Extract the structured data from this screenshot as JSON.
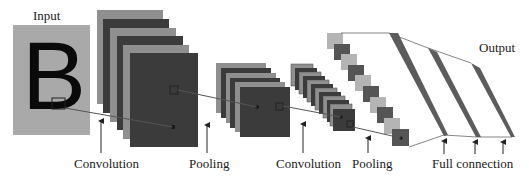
{
  "labels": {
    "input": "Input",
    "output": "Output",
    "conv1": "Convolution",
    "pool1": "Pooling",
    "conv2": "Convolution",
    "pool2": "Pooling",
    "fc": "Full connection"
  },
  "input_letter": "B",
  "colors": {
    "input_bg": "#a9a9a9",
    "layer_light": "#8f8f8f",
    "layer_dark": "#3b3b3b",
    "pool_light": "#b4b4b4",
    "pool_dark": "#555555",
    "stripe": "#5c5c5c",
    "line": "#555555",
    "arrow": "#222222"
  },
  "stages": [
    {
      "name": "input",
      "layers": 1
    },
    {
      "name": "convolution-1",
      "layers": 6
    },
    {
      "name": "pooling-1",
      "layers": 6
    },
    {
      "name": "convolution-2",
      "layers": 12
    },
    {
      "name": "pooling-2",
      "layers": 10
    },
    {
      "name": "full-connection",
      "layers": 3
    }
  ]
}
